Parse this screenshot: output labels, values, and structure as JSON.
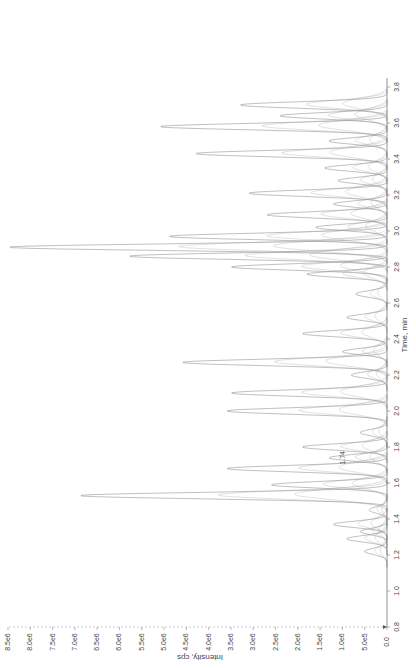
{
  "chart_data": {
    "type": "line",
    "orientation": "rotated-90-clockwise",
    "title": "",
    "xlabel": "Time, min",
    "ylabel": "Intensity, cps",
    "xlim": [
      0.8,
      3.85
    ],
    "ylim": [
      0,
      8500000.0
    ],
    "x_ticks": [
      "0.8",
      "1.0",
      "1.2",
      "1.4",
      "1.6",
      "1.8",
      "2.0",
      "2.2",
      "2.4",
      "2.6",
      "2.8",
      "3.0",
      "3.2",
      "3.4",
      "3.6",
      "3.8"
    ],
    "y_ticks": [
      "0.0",
      "5.0e5",
      "1.0e6",
      "1.5e6",
      "2.0e6",
      "2.5e6",
      "3.0e6",
      "3.5e6",
      "4.0e6",
      "4.5e6",
      "5.0e6",
      "5.5e6",
      "6.0e6",
      "6.5e6",
      "7.0e6",
      "7.5e6",
      "8.0e6",
      "8.5e6"
    ],
    "grid": false,
    "legend": null,
    "annotations": [
      {
        "x": 1.74,
        "label": "1.74"
      }
    ],
    "line_color": "#9a9a9a",
    "series": [
      {
        "name": "overlaid XIC traces",
        "peaks": [
          {
            "t": 1.22,
            "i": 500000.0
          },
          {
            "t": 1.29,
            "i": 900000.0
          },
          {
            "t": 1.33,
            "i": 600000.0
          },
          {
            "t": 1.37,
            "i": 1200000.0
          },
          {
            "t": 1.45,
            "i": 400000.0
          },
          {
            "t": 1.53,
            "i": 6900000.0
          },
          {
            "t": 1.59,
            "i": 2600000.0
          },
          {
            "t": 1.68,
            "i": 3600000.0
          },
          {
            "t": 1.74,
            "i": 1300000.0
          },
          {
            "t": 1.8,
            "i": 1900000.0
          },
          {
            "t": 1.88,
            "i": 600000.0
          },
          {
            "t": 2.0,
            "i": 3600000.0
          },
          {
            "t": 2.1,
            "i": 3500000.0
          },
          {
            "t": 2.2,
            "i": 800000.0
          },
          {
            "t": 2.27,
            "i": 4600000.0
          },
          {
            "t": 2.33,
            "i": 1000000.0
          },
          {
            "t": 2.43,
            "i": 1900000.0
          },
          {
            "t": 2.52,
            "i": 900000.0
          },
          {
            "t": 2.65,
            "i": 700000.0
          },
          {
            "t": 2.76,
            "i": 1800000.0
          },
          {
            "t": 2.8,
            "i": 3500000.0
          },
          {
            "t": 2.86,
            "i": 5800000.0
          },
          {
            "t": 2.91,
            "i": 8500000.0
          },
          {
            "t": 2.97,
            "i": 4900000.0
          },
          {
            "t": 3.02,
            "i": 1600000.0
          },
          {
            "t": 3.09,
            "i": 2700000.0
          },
          {
            "t": 3.15,
            "i": 1200000.0
          },
          {
            "t": 3.21,
            "i": 3100000.0
          },
          {
            "t": 3.28,
            "i": 1100000.0
          },
          {
            "t": 3.35,
            "i": 1400000.0
          },
          {
            "t": 3.43,
            "i": 4300000.0
          },
          {
            "t": 3.5,
            "i": 1300000.0
          },
          {
            "t": 3.58,
            "i": 5100000.0
          },
          {
            "t": 3.64,
            "i": 2400000.0
          },
          {
            "t": 3.7,
            "i": 3300000.0
          }
        ]
      }
    ]
  }
}
